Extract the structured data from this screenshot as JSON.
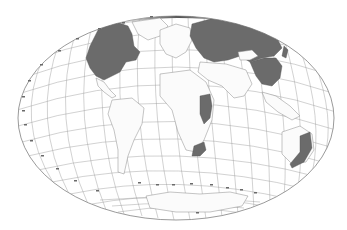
{
  "map": {
    "projection": "oblique equal-area world projection (elliptical)",
    "background_color": "#ffffff",
    "land_color": "#fbfbfb",
    "shaded_color": "#6b6b6b",
    "graticule_color": "#9a9a9a",
    "shaded_regions": [
      {
        "name": "North America (Canada / United States)",
        "id": "north-america"
      },
      {
        "name": "Northern Eurasia (Russia)",
        "id": "eurasia-north"
      },
      {
        "name": "China / East Asia",
        "id": "east-asia"
      },
      {
        "name": "East Africa",
        "id": "east-africa"
      },
      {
        "name": "Southern Africa",
        "id": "southern-africa"
      },
      {
        "name": "Eastern Australia",
        "id": "eastern-australia"
      }
    ],
    "unshaded_features": [
      "South America",
      "Europe",
      "Africa (central/west)",
      "Middle East",
      "South Asia",
      "Southeast Asia",
      "Antarctica",
      "Greenland"
    ],
    "graticule": "latitude/longitude grid lines with small degree tick labels around the ellipse edge (illegible at this resolution)"
  }
}
